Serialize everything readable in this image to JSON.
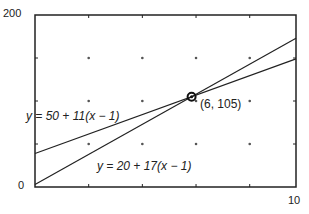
{
  "chart_data": {
    "type": "line",
    "title": "",
    "xlabel": "",
    "ylabel": "",
    "xlim": [
      0,
      10
    ],
    "ylim": [
      0,
      200
    ],
    "x_ticks_labeled": [
      "0",
      "10"
    ],
    "y_ticks_labeled": [
      "0",
      "200"
    ],
    "grid": "dotted",
    "series": [
      {
        "name": "y = 50 + 11(x − 1)",
        "x": [
          0,
          10
        ],
        "values": [
          39,
          149
        ]
      },
      {
        "name": "y = 20 + 17(x − 1)",
        "x": [
          0,
          10
        ],
        "values": [
          3,
          173
        ]
      }
    ],
    "annotations": [
      {
        "label": "(6, 105)",
        "x": 6,
        "y": 105
      }
    ]
  },
  "labels": {
    "y_max": "200",
    "y_min": "0",
    "x_max": "10",
    "line1": "y = 50 + 11(x − 1)",
    "line2": "y = 20 + 17(x − 1)",
    "point": "(6, 105)"
  }
}
